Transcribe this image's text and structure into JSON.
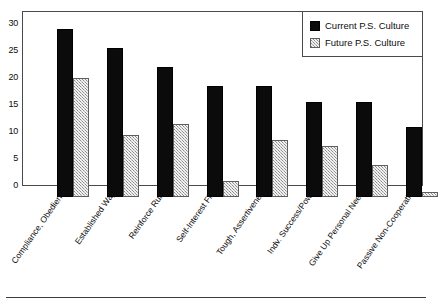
{
  "chart_data": {
    "type": "bar",
    "title": "",
    "subtitle": "",
    "xlabel": "",
    "ylabel": "",
    "ylim": [
      0,
      32
    ],
    "yticks": [
      0,
      5,
      10,
      15,
      20,
      25,
      30
    ],
    "ytick_labels": [
      "0",
      "5",
      "10",
      "15",
      "20",
      "25",
      "30"
    ],
    "grid": false,
    "legend_position": "top-right",
    "categories": [
      "Compliance, Obedience",
      "Established Ways",
      "Reinforce Rules",
      "Self-Interest First",
      "Tough, Assertiveness",
      "Indv. Success/Power",
      "Give Up Personal Needs",
      "Passive Non-Cooperation"
    ],
    "series": [
      {
        "name": "Current P.S. Culture",
        "color": "#0b0b0b",
        "values": [
          31,
          27.5,
          24,
          20.5,
          20.5,
          17.5,
          17.5,
          13
        ]
      },
      {
        "name": "Future P.S. Culture",
        "color": "#b4b4b4",
        "values": [
          22,
          11.5,
          13.5,
          3,
          10.5,
          9.5,
          6,
          1
        ]
      }
    ]
  },
  "legend": {
    "items": [
      {
        "label": "Current P.S. Culture",
        "swatch": "current"
      },
      {
        "label": "Future P.S. Culture",
        "swatch": "future"
      }
    ]
  }
}
